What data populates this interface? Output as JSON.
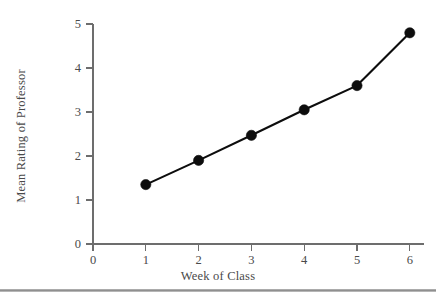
{
  "chart_data": {
    "type": "line",
    "title": "",
    "subtitle": "",
    "xlabel": "Week of Class",
    "ylabel": "Mean Rating of Professor",
    "x": [
      1,
      2,
      3,
      4,
      5,
      6
    ],
    "values": [
      1.35,
      1.9,
      2.47,
      3.05,
      3.6,
      4.8
    ],
    "series": [
      {
        "name": "Mean Rating of Professor",
        "values": [
          1.35,
          1.9,
          2.47,
          3.05,
          3.6,
          4.8
        ]
      }
    ],
    "xlim": [
      0,
      6
    ],
    "ylim": [
      0,
      5
    ],
    "xticks": [
      0,
      1,
      2,
      3,
      4,
      5,
      6
    ],
    "yticks": [
      0,
      1,
      2,
      3,
      4,
      5
    ],
    "xtick_labels": [
      "0",
      "1",
      "2",
      "3",
      "4",
      "5",
      "6"
    ],
    "ytick_labels": [
      "0",
      "1",
      "2",
      "3",
      "4",
      "5"
    ],
    "grid": false,
    "legend": false,
    "legend_position": "none",
    "marker": "filled-circle",
    "line_color": "#0d0d0d",
    "marker_color": "#0d0d0d",
    "axis_color": "#6d6d6d",
    "background_color": "#ffffff",
    "annotations": []
  },
  "figure": {
    "footer_rule_color": "#8f8f8f"
  }
}
